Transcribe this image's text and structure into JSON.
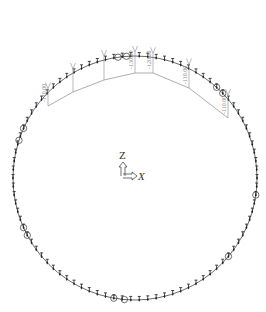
{
  "diagram": {
    "title_fragment": "",
    "ring": {
      "cx": 135,
      "cy": 178,
      "r": 122,
      "color": "#444444",
      "node_count": 90
    },
    "load_color": "#8a8a8a",
    "loads": [
      {
        "x": 48,
        "label": "-110.00"
      },
      {
        "x": 73,
        "label": ""
      },
      {
        "x": 104,
        "label": ""
      },
      {
        "x": 135,
        "label": "-130.00"
      },
      {
        "x": 153,
        "label": "-120.00"
      },
      {
        "x": 189,
        "label": "-110.00"
      },
      {
        "x": 228,
        "label": "-110.00"
      }
    ],
    "support_circles": [
      {
        "angle": 204
      },
      {
        "angle": 198
      },
      {
        "angle": 262
      },
      {
        "angle": 266
      },
      {
        "angle": 312
      },
      {
        "angle": 316
      },
      {
        "angle": 152
      },
      {
        "angle": 156
      },
      {
        "angle": 95
      },
      {
        "angle": 100
      },
      {
        "angle": 8
      },
      {
        "angle": 40
      }
    ],
    "axes": {
      "z_label": "Z",
      "x_label": "X",
      "origin": [
        123,
        176
      ]
    }
  }
}
